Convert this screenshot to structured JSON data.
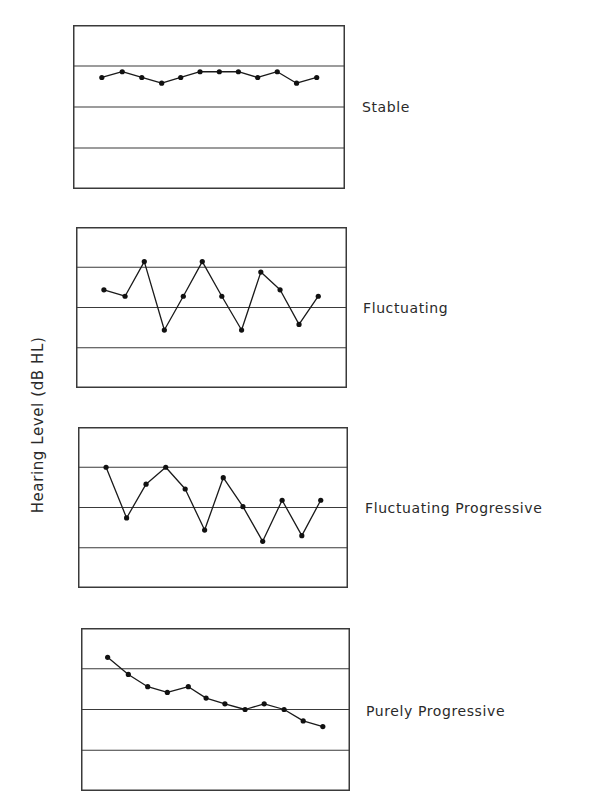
{
  "chart_data": [
    {
      "type": "line",
      "title": "Stable",
      "ylabel": "Hearing Level (dB HL)",
      "xlabel": "",
      "grid": true,
      "ylim": [
        0,
        100
      ],
      "yticks_gridlines": [
        25,
        50,
        75
      ],
      "x": [
        10.6,
        18.1,
        25.3,
        32.6,
        39.6,
        46.7,
        53.8,
        60.8,
        67.9,
        75.1,
        82.2,
        89.6
      ],
      "values": [
        32,
        28.5,
        32,
        35.5,
        32,
        28.5,
        28.5,
        28.5,
        32,
        28.5,
        35.5,
        32
      ]
    },
    {
      "type": "line",
      "title": "Fluctuating",
      "ylabel": "Hearing Level (dB HL)",
      "xlabel": "",
      "grid": true,
      "ylim": [
        0,
        100
      ],
      "yticks_gridlines": [
        25,
        50,
        75
      ],
      "x": [
        10.3,
        18.1,
        25.2,
        32.6,
        39.6,
        46.6,
        53.8,
        61.1,
        68.2,
        75.3,
        82.3,
        89.4
      ],
      "values": [
        39,
        43,
        21.5,
        64,
        43,
        21.5,
        43,
        64,
        28,
        39,
        60.5,
        43
      ]
    },
    {
      "type": "line",
      "title": "Fluctuating Progressive",
      "ylabel": "Hearing Level (dB HL)",
      "xlabel": "",
      "grid": true,
      "ylim": [
        0,
        100
      ],
      "yticks_gridlines": [
        25,
        50,
        75
      ],
      "x": [
        10.4,
        18.0,
        25.2,
        32.5,
        39.7,
        46.9,
        53.8,
        61.1,
        68.4,
        75.6,
        82.9,
        89.9
      ],
      "values": [
        25,
        56.5,
        35.5,
        25,
        38.5,
        64,
        31.5,
        49.5,
        71,
        45.5,
        67.5,
        45.5
      ]
    },
    {
      "type": "line",
      "title": "Purely Progressive",
      "ylabel": "Hearing Level (dB HL)",
      "xlabel": "",
      "grid": true,
      "ylim": [
        0,
        100
      ],
      "yticks_gridlines": [
        25,
        50,
        75
      ],
      "x": [
        9.9,
        17.6,
        24.8,
        32.1,
        39.9,
        46.5,
        53.5,
        61.0,
        68.1,
        75.5,
        82.6,
        89.9
      ],
      "values": [
        18,
        28.5,
        36,
        39.5,
        36,
        43,
        46.5,
        50,
        46.5,
        50,
        57,
        60.5
      ]
    }
  ],
  "figure": {
    "ylabel": "Hearing Level (dB HL)",
    "panels": [
      {
        "label": "Stable"
      },
      {
        "label": "Fluctuating"
      },
      {
        "label": "Fluctuating Progressive"
      },
      {
        "label": "Purely Progressive"
      }
    ]
  },
  "colors": {
    "line": "#1a1a1a",
    "marker": "#111111",
    "frame": "#3a3a3a",
    "grid": "#3a3a3a",
    "text": "#2a2a2a"
  }
}
